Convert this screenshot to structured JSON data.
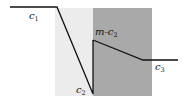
{
  "diagram": {
    "regions": [
      {
        "name": "light-region",
        "x": 55,
        "y": 8,
        "w": 38,
        "h": 88,
        "color": "#ececec"
      },
      {
        "name": "dark-region",
        "x": 93,
        "y": 8,
        "w": 59,
        "h": 88,
        "color": "#a8a8a8"
      }
    ],
    "line_color": "#111111",
    "labels": {
      "c1": {
        "main": "c",
        "sub": "1"
      },
      "c2": {
        "main": "c",
        "sub": "2"
      },
      "m_c2": {
        "main": "m-c",
        "sub": "2"
      },
      "c3": {
        "main": "c",
        "sub": "3"
      }
    }
  }
}
